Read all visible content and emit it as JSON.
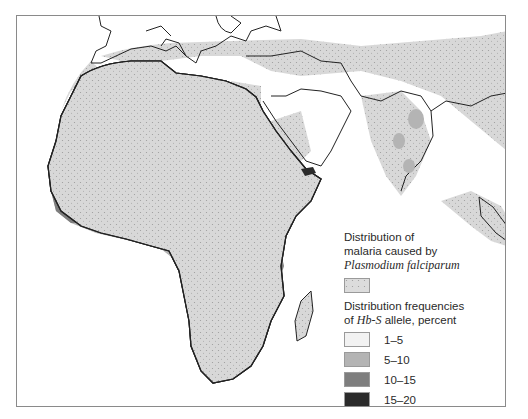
{
  "legend": {
    "malaria_title_line1": "Distribution of",
    "malaria_title_line2": "malaria caused by",
    "malaria_species": "Plasmodium falciparum",
    "malaria_color": "#dcdcdc",
    "freq_title_line1": "Distribution frequencies",
    "freq_title_prefix": "of ",
    "freq_allele": "Hb-S",
    "freq_title_suffix": " allele, percent",
    "classes": [
      {
        "label": "1–5",
        "color": "#f2f2f2"
      },
      {
        "label": "5–10",
        "color": "#b4b4b4"
      },
      {
        "label": "10–15",
        "color": "#7e7e7e"
      },
      {
        "label": "15–20",
        "color": "#2b2b2b"
      }
    ]
  },
  "colors": {
    "land_outline": "#222222",
    "malaria": "#d6d6d6",
    "frame": "#8a8a8a"
  }
}
